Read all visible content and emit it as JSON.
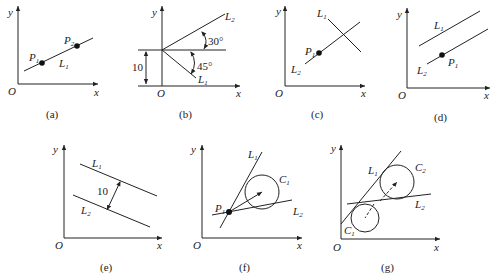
{
  "figure": {
    "axis_labels": {
      "x": "x",
      "y": "y",
      "origin": "O"
    },
    "panels": [
      {
        "id": "a",
        "caption": "(a)",
        "lines": [
          "L1"
        ],
        "points": [
          "P1",
          "P2"
        ],
        "labels": {
          "line1": "L",
          "line1_sub": "1",
          "p1": "P",
          "p1_sub": "1",
          "p2": "P",
          "p2_sub": "2"
        }
      },
      {
        "id": "b",
        "caption": "(b)",
        "lines": [
          "L1",
          "L2"
        ],
        "labels": {
          "line1": "L",
          "line1_sub": "1",
          "line2": "L",
          "line2_sub": "2",
          "angle1": "30°",
          "angle2": "45°",
          "offset": "10"
        }
      },
      {
        "id": "c",
        "caption": "(c)",
        "lines": [
          "L1",
          "L2"
        ],
        "points": [
          "P1"
        ],
        "labels": {
          "line1": "L",
          "line1_sub": "1",
          "line2": "L",
          "line2_sub": "2",
          "p1": "P",
          "p1_sub": "1"
        }
      },
      {
        "id": "d",
        "caption": "(d)",
        "lines": [
          "L1",
          "L2"
        ],
        "points": [
          "P1"
        ],
        "labels": {
          "line1": "L",
          "line1_sub": "1",
          "line2": "L",
          "line2_sub": "2",
          "p1": "P",
          "p1_sub": "1"
        }
      },
      {
        "id": "e",
        "caption": "(e)",
        "lines": [
          "L1",
          "L2"
        ],
        "labels": {
          "line1": "L",
          "line1_sub": "1",
          "line2": "L",
          "line2_sub": "2",
          "distance": "10"
        }
      },
      {
        "id": "f",
        "caption": "(f)",
        "lines": [
          "L1",
          "L2"
        ],
        "points": [
          "P1"
        ],
        "circles": [
          "C1"
        ],
        "labels": {
          "line1": "L",
          "line1_sub": "1",
          "line2": "L",
          "line2_sub": "2",
          "p1": "P",
          "p1_sub": "1",
          "c1": "C",
          "c1_sub": "1"
        }
      },
      {
        "id": "g",
        "caption": "(g)",
        "lines": [
          "L1",
          "L2"
        ],
        "circles": [
          "C1",
          "C2"
        ],
        "labels": {
          "line1": "L",
          "line1_sub": "1",
          "line2": "L",
          "line2_sub": "2",
          "c1": "C",
          "c1_sub": "1",
          "c2": "C",
          "c2_sub": "2"
        }
      }
    ]
  }
}
